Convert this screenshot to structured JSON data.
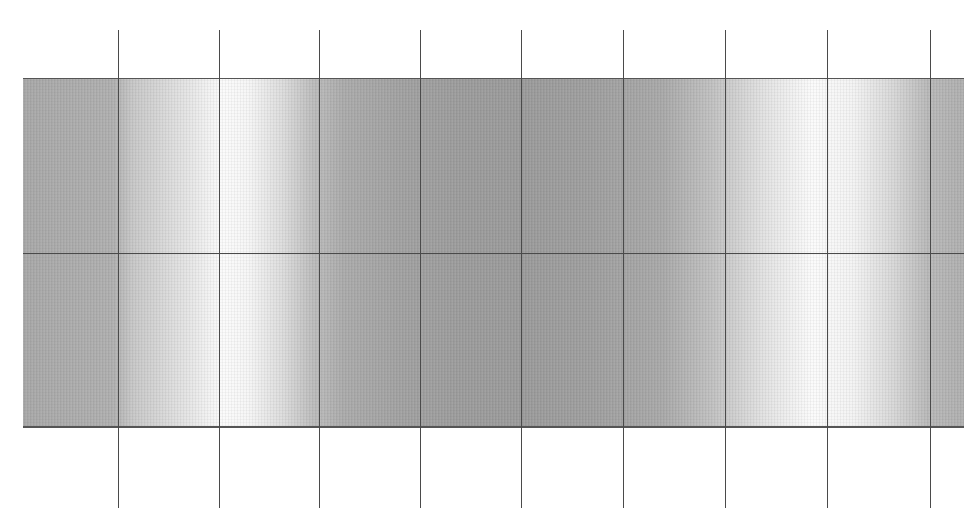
{
  "figure": {
    "strip": {
      "left": 23,
      "top": 78,
      "width": 941,
      "height": 350
    },
    "horizontal_lines_y": [
      78,
      253,
      428
    ],
    "vertical_lines_x": [
      118,
      219,
      319,
      420,
      521,
      623,
      725,
      827,
      930
    ],
    "vertical_line_extent": {
      "top": 30,
      "bottom": 508
    },
    "colors": {
      "line": "#4a4a4a",
      "light_band": "#fbfbfb",
      "dark_band": "#9c9c9c",
      "background": "#ffffff"
    }
  }
}
